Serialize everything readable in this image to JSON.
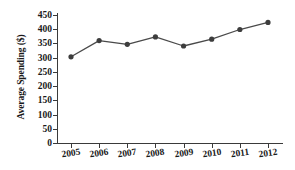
{
  "chart_data": {
    "type": "line",
    "title": "",
    "xlabel": "",
    "ylabel": "Average Spending ($)",
    "categories": [
      "2005",
      "2006",
      "2007",
      "2008",
      "2009",
      "2010",
      "2011",
      "2012"
    ],
    "values": [
      303,
      360,
      347,
      373,
      341,
      365,
      399,
      424
    ],
    "series": [
      {
        "name": "Average Spending",
        "values": [
          303,
          360,
          347,
          373,
          341,
          365,
          399,
          424
        ]
      }
    ],
    "ylim": [
      0,
      450
    ],
    "yticks": [
      0,
      50,
      100,
      150,
      200,
      250,
      300,
      350,
      400,
      450
    ],
    "ytick_labels": [
      "0",
      "50",
      "100",
      "150",
      "200",
      "250",
      "300",
      "350",
      "400",
      "450"
    ],
    "xtick_labels": [
      "2005",
      "2006",
      "2007",
      "2008",
      "2009",
      "2010",
      "2011",
      "2012"
    ],
    "grid": false,
    "legend": false,
    "legend_position": "none",
    "marker": "circle",
    "line_color": "#4a4a4a",
    "marker_color": "#3d3d3d",
    "axis_color": "#3a3a3a",
    "background_color": "#ffffff"
  }
}
